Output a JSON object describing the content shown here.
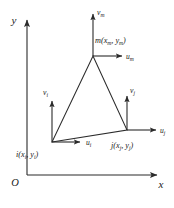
{
  "figure": {
    "background_color": "#ffffff",
    "line_color": "#2b2b2b",
    "text_color": "#1a1a1a"
  },
  "axes": {
    "y_label": "y",
    "x_label": "x",
    "origin_label": "O",
    "y_axis": {
      "x": 27,
      "y_top": 18,
      "y_bottom": 175
    },
    "x_axis": {
      "y": 175,
      "x_left": 27,
      "x_right": 160
    }
  },
  "element": {
    "shape": "triangle",
    "nodes": [
      {
        "id": "i",
        "label": "i(x",
        "label_sub1": "i",
        "label_mid": ", y",
        "label_sub2": "i",
        "label_end": ")",
        "px": {
          "x": 52,
          "y": 142
        },
        "label_pos": {
          "x": 17,
          "y": 156
        },
        "u_vector": {
          "name": "u",
          "subscript": "i",
          "tip": {
            "x": 84,
            "y": 142
          },
          "label_pos": {
            "x": 87,
            "y": 145
          }
        },
        "v_vector": {
          "name": "v",
          "subscript": "i",
          "tip": {
            "x": 52,
            "y": 98
          },
          "label_pos": {
            "x": 44,
            "y": 94
          }
        }
      },
      {
        "id": "j",
        "label": "j(x",
        "label_sub1": "j",
        "label_mid": ", y",
        "label_sub2": "j",
        "label_end": ")",
        "px": {
          "x": 127,
          "y": 130
        },
        "label_pos": {
          "x": 112,
          "y": 147
        },
        "u_vector": {
          "name": "u",
          "subscript": "j",
          "tip": {
            "x": 160,
            "y": 130
          },
          "label_pos": {
            "x": 162,
            "y": 133
          }
        },
        "v_vector": {
          "name": "v",
          "subscript": "j",
          "tip": {
            "x": 127,
            "y": 93
          },
          "label_pos": {
            "x": 130,
            "y": 91
          }
        }
      },
      {
        "id": "m",
        "label": "m(x",
        "label_sub1": "m",
        "label_mid": ", y",
        "label_sub2": "m",
        "label_end": ")",
        "px": {
          "x": 93,
          "y": 56
        },
        "label_pos": {
          "x": 96,
          "y": 42
        },
        "u_vector": {
          "name": "u",
          "subscript": "m",
          "tip": {
            "x": 126,
            "y": 56
          },
          "label_pos": {
            "x": 129,
            "y": 59
          }
        },
        "v_vector": {
          "name": "v",
          "subscript": "m",
          "tip": {
            "x": 93,
            "y": 11
          },
          "label_pos": {
            "x": 96,
            "y": 14
          }
        }
      }
    ]
  }
}
